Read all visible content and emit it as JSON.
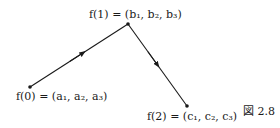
{
  "diagram": {
    "points": [
      {
        "id": "p0",
        "label": "f(0) = (a₁, a₂, a₃)",
        "x": 30,
        "y": 87
      },
      {
        "id": "p1",
        "label": "f(1) = (b₁, b₂, b₃)",
        "x": 128,
        "y": 24
      },
      {
        "id": "p2",
        "label": "f(2) = (c₁, c₂, c₃)",
        "x": 187,
        "y": 106
      }
    ],
    "edges": [
      {
        "from": "p0",
        "to": "p1",
        "arrow": "mid"
      },
      {
        "from": "p1",
        "to": "p2",
        "arrow": "mid"
      }
    ],
    "caption": "図 2.8",
    "colors": {
      "stroke": "#1a1a1a",
      "background": "#ffffff"
    }
  }
}
